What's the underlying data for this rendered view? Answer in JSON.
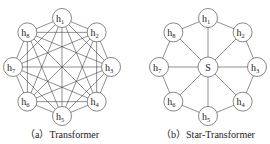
{
  "diagrams": [
    {
      "id": "transformer",
      "caption": "（a）Transformer",
      "center": [
        62,
        67
      ],
      "radius": 49,
      "node_radius": 9.5,
      "connectivity": "fully-connected",
      "nodes": [
        {
          "base": "h",
          "sub": "1"
        },
        {
          "base": "h",
          "sub": "2"
        },
        {
          "base": "h",
          "sub": "3"
        },
        {
          "base": "h",
          "sub": "4"
        },
        {
          "base": "h",
          "sub": "5"
        },
        {
          "base": "h",
          "sub": "6"
        },
        {
          "base": "h",
          "sub": "7"
        },
        {
          "base": "h",
          "sub": "8"
        }
      ]
    },
    {
      "id": "star-transformer",
      "caption": "（b）Star-Transformer",
      "center": [
        208,
        67
      ],
      "radius": 49,
      "node_radius": 9.5,
      "connectivity": "ring-plus-relay",
      "relay": {
        "label": "S"
      },
      "nodes": [
        {
          "base": "h",
          "sub": "1"
        },
        {
          "base": "h",
          "sub": "2"
        },
        {
          "base": "h",
          "sub": "3"
        },
        {
          "base": "h",
          "sub": "4"
        },
        {
          "base": "h",
          "sub": "5"
        },
        {
          "base": "h",
          "sub": "6"
        },
        {
          "base": "h",
          "sub": "7"
        },
        {
          "base": "h",
          "sub": "8"
        }
      ]
    }
  ],
  "colors": {
    "stroke": "#444444",
    "node_fill": "#ffffff",
    "text": "#222222"
  }
}
